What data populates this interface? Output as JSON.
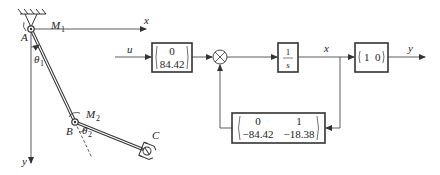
{
  "mechanism": {
    "axis_x_label": "x",
    "axis_y_label": "y",
    "joint_a_label": "A",
    "joint_b_label": "B",
    "end_effector_label": "C",
    "moment_1_label": "M",
    "moment_1_sub": "1",
    "moment_2_label": "M",
    "moment_2_sub": "2",
    "theta_1_label": "θ",
    "theta_1_sub": "1",
    "theta_2_label": "θ",
    "theta_2_sub": "2"
  },
  "block_diagram": {
    "input_label": "u",
    "input_matrix": {
      "row1": "0",
      "row2": "84.42"
    },
    "integrator": {
      "numerator": "1",
      "denominator": "s"
    },
    "state_label": "x",
    "output_matrix": {
      "c1": "1",
      "c2": "0"
    },
    "output_label": "y",
    "feedback_matrix": {
      "r1c1": "0",
      "r1c2": "1",
      "r2c1": "−84.42",
      "r2c2": "−18.38"
    }
  },
  "colors": {
    "line": "#333333",
    "text": "#222222",
    "background": "#ffffff"
  }
}
